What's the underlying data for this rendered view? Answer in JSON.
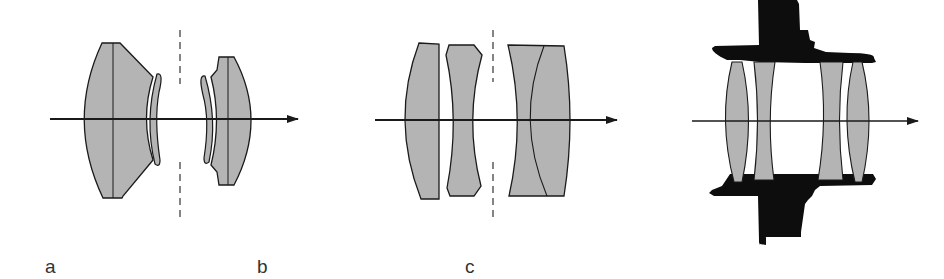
{
  "figure": {
    "colors": {
      "glass_fill": "#b4b4b4",
      "outline": "#1a1a1a",
      "mount": "#0d0d0d",
      "background": "#ffffff"
    },
    "panels": [
      {
        "id": "a",
        "label": "a",
        "elements": 4,
        "has_aperture_stop": true
      },
      {
        "id": "b",
        "label": "b",
        "elements": 4,
        "has_aperture_stop": true
      },
      {
        "id": "c",
        "label": "c",
        "elements": 4,
        "has_lens_mount": true
      }
    ]
  }
}
